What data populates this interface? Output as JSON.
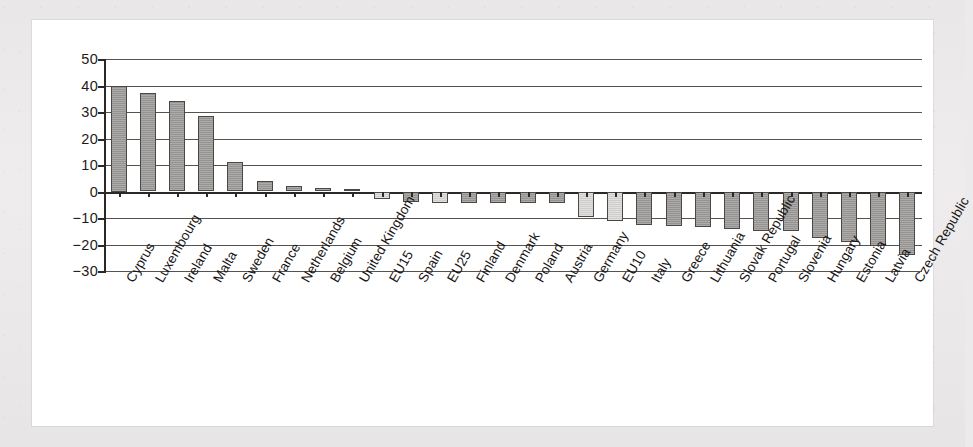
{
  "figure": {
    "panel_background": "#ffffff",
    "page_background": "#eceaea",
    "bar_color_country": "#9d9b99",
    "bar_color_aggregate": "#d8d6d4",
    "axis_color": "#2b2927"
  },
  "chart_data": {
    "type": "bar",
    "title": "",
    "xlabel": "",
    "ylabel": "",
    "ylim": [
      -30,
      50
    ],
    "yticks": [
      50,
      40,
      30,
      20,
      10,
      0,
      -10,
      -20,
      -30
    ],
    "ytick_labels": [
      "50",
      "40",
      "30",
      "20",
      "10",
      "0",
      "−10",
      "−20",
      "−30"
    ],
    "grid": true,
    "legend": null,
    "orientation": "vertical",
    "categories": [
      "Cyprus",
      "Luxembourg",
      "Ireland",
      "Malta",
      "Sweden",
      "France",
      "Netherlands",
      "Belgium",
      "United Kingdom",
      "EU15",
      "Spain",
      "EU25",
      "Finland",
      "Denmark",
      "Poland",
      "Austria",
      "Germany",
      "EU10",
      "Italy",
      "Greece",
      "Lithuania",
      "Slovak Republic",
      "Portugal",
      "Slovenia",
      "Hungary",
      "Estonia",
      "Latvia",
      "Czech Republic"
    ],
    "values": [
      40,
      37,
      34,
      28.5,
      11,
      4,
      2,
      1.5,
      1,
      -3,
      -4,
      -4.5,
      -4.5,
      -4.5,
      -4.5,
      -4.5,
      -9.5,
      -11,
      -12.5,
      -13,
      -13.5,
      -14,
      -15,
      -15,
      -17.5,
      -19,
      -20.5,
      -24
    ],
    "series_kind": [
      "country",
      "country",
      "country",
      "country",
      "country",
      "country",
      "country",
      "country",
      "country",
      "aggregate",
      "country",
      "aggregate",
      "country",
      "country",
      "country",
      "country",
      "aggregate",
      "aggregate",
      "country",
      "country",
      "country",
      "country",
      "country",
      "country",
      "country",
      "country",
      "country",
      "country"
    ]
  }
}
